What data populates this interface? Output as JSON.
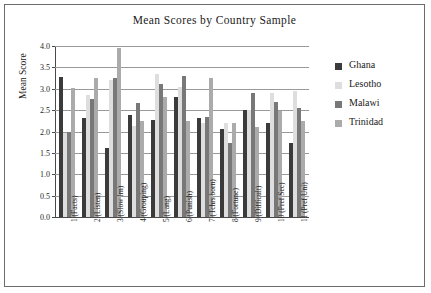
{
  "chart_data": {
    "type": "bar",
    "title": "Mean Scores by Country Sample",
    "xlabel": "",
    "ylabel": "Mean Score",
    "ylim": [
      0.0,
      4.0
    ],
    "yticks": [
      "0.0",
      "0.5",
      "1.0",
      "1.5",
      "2.0",
      "2.5",
      "3.0",
      "3.5",
      "4.0"
    ],
    "grid": true,
    "legend_position": "right",
    "categories": [
      "1 (Facts)",
      "2 (Listen)",
      "3 (Slow lrn)",
      "4 (Grouping)",
      "5 (Lang)",
      "6 (Punish)",
      "7 (Tchrs born)",
      "8 (Fortune)",
      "9 (Difficult)",
      "10 (Pref Sec)",
      "11 (Pref Uni)"
    ],
    "series": [
      {
        "name": "Ghana",
        "color": "#3b3b3b",
        "values": [
          3.28,
          2.31,
          1.62,
          2.38,
          2.26,
          2.81,
          2.31,
          2.05,
          2.5,
          2.19,
          1.72
        ]
      },
      {
        "name": "Lesotho",
        "color": "#dedede",
        "values": [
          1.97,
          2.86,
          3.2,
          2.13,
          3.35,
          3.05,
          2.2,
          2.19,
          2.51,
          2.89,
          2.94
        ]
      },
      {
        "name": "Malawi",
        "color": "#787878",
        "values": [
          2.0,
          2.76,
          3.26,
          2.67,
          3.12,
          3.31,
          2.35,
          1.73,
          2.9,
          2.69,
          2.54
        ]
      },
      {
        "name": "Trinidad",
        "color": "#ababab",
        "values": [
          3.02,
          3.26,
          3.96,
          2.25,
          2.8,
          2.25,
          3.25,
          2.19,
          2.1,
          2.49,
          2.24
        ]
      }
    ]
  },
  "legend": {
    "items": [
      {
        "label": "Ghana"
      },
      {
        "label": "Lesotho"
      },
      {
        "label": "Malawi"
      },
      {
        "label": "Trinidad"
      }
    ]
  }
}
